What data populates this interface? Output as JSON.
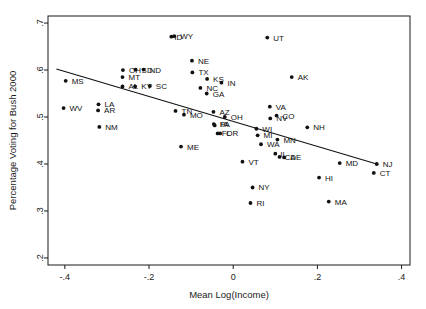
{
  "chart_data": {
    "type": "scatter",
    "title": "",
    "xlabel": "Mean Log(Income)",
    "ylabel": "Percentage Voting for Bush 2000",
    "xlim": [
      -0.44,
      0.42
    ],
    "ylim": [
      0.185,
      0.715
    ],
    "xticks": [
      "-.4",
      "-.2",
      "0",
      ".2",
      ".4"
    ],
    "xtick_values": [
      -0.4,
      -0.2,
      0,
      0.2,
      0.4
    ],
    "yticks": [
      ".2",
      ".3",
      ".4",
      ".5",
      ".6",
      ".7"
    ],
    "ytick_values": [
      0.2,
      0.3,
      0.4,
      0.5,
      0.6,
      0.7
    ],
    "grid": false,
    "legend": "none",
    "point_color": "#111111",
    "line_color": "#111111",
    "fit_line": {
      "x0": -0.42,
      "y0": 0.602,
      "x1": 0.345,
      "y1": 0.399
    },
    "points": [
      {
        "label": "MS",
        "x": -0.398,
        "y": 0.577,
        "lx": 6,
        "ly": 3
      },
      {
        "label": "WV",
        "x": -0.403,
        "y": 0.519,
        "lx": 6,
        "ly": 3
      },
      {
        "label": "LA",
        "x": -0.32,
        "y": 0.527,
        "lx": 6,
        "ly": 3
      },
      {
        "label": "AR",
        "x": -0.321,
        "y": 0.514,
        "lx": 6,
        "ly": 3
      },
      {
        "label": "NM",
        "x": -0.318,
        "y": 0.479,
        "lx": 6,
        "ly": 3
      },
      {
        "label": "OH",
        "x": -0.262,
        "y": 0.6,
        "lx": 6,
        "ly": 3
      },
      {
        "label": "SD",
        "x": -0.232,
        "y": 0.601,
        "lx": 6,
        "ly": 3
      },
      {
        "label": "ND",
        "x": -0.213,
        "y": 0.601,
        "lx": 6,
        "ly": 3
      },
      {
        "label": "MT",
        "x": -0.263,
        "y": 0.585,
        "lx": 6,
        "ly": 3
      },
      {
        "label": "AL",
        "x": -0.263,
        "y": 0.565,
        "lx": 6,
        "ly": 3
      },
      {
        "label": "KY",
        "x": -0.233,
        "y": 0.565,
        "lx": 6,
        "ly": 3
      },
      {
        "label": "SC",
        "x": -0.198,
        "y": 0.566,
        "lx": 6,
        "ly": 3
      },
      {
        "label": "ID",
        "x": -0.147,
        "y": 0.671,
        "lx": 3,
        "ly": 3
      },
      {
        "label": "WY",
        "x": -0.14,
        "y": 0.672,
        "lx": 6,
        "ly": 3
      },
      {
        "label": "NE",
        "x": -0.098,
        "y": 0.62,
        "lx": 6,
        "ly": 3
      },
      {
        "label": "TX",
        "x": -0.097,
        "y": 0.595,
        "lx": 6,
        "ly": 3
      },
      {
        "label": "KS",
        "x": -0.062,
        "y": 0.581,
        "lx": 6,
        "ly": 3
      },
      {
        "label": "IN",
        "x": -0.028,
        "y": 0.573,
        "lx": 6,
        "ly": 3
      },
      {
        "label": "NC",
        "x": -0.078,
        "y": 0.562,
        "lx": 6,
        "ly": 3
      },
      {
        "label": "GA",
        "x": -0.063,
        "y": 0.55,
        "lx": 6,
        "ly": 3
      },
      {
        "label": "TN",
        "x": -0.137,
        "y": 0.513,
        "lx": 6,
        "ly": 3
      },
      {
        "label": "MO",
        "x": -0.117,
        "y": 0.505,
        "lx": 6,
        "ly": 3
      },
      {
        "label": "AZ",
        "x": -0.047,
        "y": 0.511,
        "lx": 6,
        "ly": 3
      },
      {
        "label": "OH2",
        "x": -0.02,
        "y": 0.5,
        "lx": 6,
        "ly": 3
      },
      {
        "label": "PA",
        "x": -0.046,
        "y": 0.485,
        "lx": 6,
        "ly": 3
      },
      {
        "label": "IA",
        "x": -0.044,
        "y": 0.482,
        "lx": 6,
        "ly": 2
      },
      {
        "label": "FL",
        "x": -0.037,
        "y": 0.465,
        "lx": 4,
        "ly": 3
      },
      {
        "label": "OR",
        "x": -0.031,
        "y": 0.465,
        "lx": 6,
        "ly": 3
      },
      {
        "label": "ME",
        "x": -0.124,
        "y": 0.437,
        "lx": 6,
        "ly": 3
      },
      {
        "label": "VT",
        "x": 0.022,
        "y": 0.405,
        "lx": 6,
        "ly": 3
      },
      {
        "label": "NY",
        "x": 0.046,
        "y": 0.35,
        "lx": 6,
        "ly": 3
      },
      {
        "label": "RI",
        "x": 0.041,
        "y": 0.317,
        "lx": 6,
        "ly": 3
      },
      {
        "label": "WI",
        "x": 0.055,
        "y": 0.475,
        "lx": 6,
        "ly": 3
      },
      {
        "label": "MI",
        "x": 0.058,
        "y": 0.461,
        "lx": 6,
        "ly": 3
      },
      {
        "label": "WA",
        "x": 0.066,
        "y": 0.442,
        "lx": 6,
        "ly": 3
      },
      {
        "label": "MN",
        "x": 0.105,
        "y": 0.452,
        "lx": 6,
        "ly": 3
      },
      {
        "label": "NV",
        "x": 0.088,
        "y": 0.497,
        "lx": 6,
        "ly": 3
      },
      {
        "label": "CO",
        "x": 0.103,
        "y": 0.503,
        "lx": 6,
        "ly": 3
      },
      {
        "label": "VA",
        "x": 0.087,
        "y": 0.522,
        "lx": 6,
        "ly": 3
      },
      {
        "label": "AK",
        "x": 0.139,
        "y": 0.585,
        "lx": 6,
        "ly": 3
      },
      {
        "label": "UT",
        "x": 0.081,
        "y": 0.669,
        "lx": 6,
        "ly": 3
      },
      {
        "label": "NH",
        "x": 0.176,
        "y": 0.478,
        "lx": 6,
        "ly": 3
      },
      {
        "label": "IL",
        "x": 0.1,
        "y": 0.422,
        "lx": 5,
        "ly": 3
      },
      {
        "label": "CA",
        "x": 0.11,
        "y": 0.415,
        "lx": 5,
        "ly": 3
      },
      {
        "label": "DE",
        "x": 0.121,
        "y": 0.414,
        "lx": 6,
        "ly": 3
      },
      {
        "label": "HI",
        "x": 0.204,
        "y": 0.371,
        "lx": 6,
        "ly": 3
      },
      {
        "label": "MA",
        "x": 0.227,
        "y": 0.32,
        "lx": 6,
        "ly": 3
      },
      {
        "label": "MD",
        "x": 0.253,
        "y": 0.402,
        "lx": 6,
        "ly": 3
      },
      {
        "label": "NJ",
        "x": 0.341,
        "y": 0.4,
        "lx": 6,
        "ly": 3
      },
      {
        "label": "CT",
        "x": 0.334,
        "y": 0.381,
        "lx": 6,
        "ly": 3
      }
    ]
  }
}
